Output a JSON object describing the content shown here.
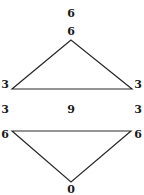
{
  "diagram": {
    "top_label": "6",
    "triangle_up": {
      "apex_label": "6",
      "left_label": "3",
      "right_label": "3"
    },
    "middle_row": {
      "left": "3",
      "center": "9",
      "right": "3"
    },
    "triangle_down": {
      "left_label": "6",
      "right_label": "6",
      "bottom_label": "0"
    },
    "line_color": "#2a2a2a"
  }
}
